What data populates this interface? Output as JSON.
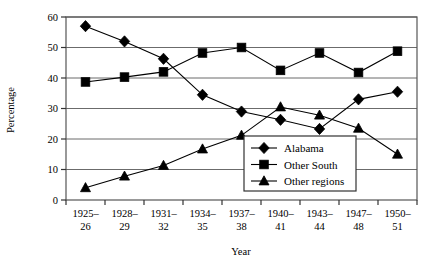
{
  "chart_data": {
    "type": "line",
    "title": "",
    "xlabel": "Year",
    "ylabel": "Percentage",
    "categories": [
      "1925–\n26",
      "1928–\n29",
      "1931–\n32",
      "1934–\n35",
      "1937–\n38",
      "1940–\n41",
      "1943–\n44",
      "1947–\n48",
      "1950–\n51"
    ],
    "categories_line1": [
      "1925–",
      "1928–",
      "1931–",
      "1934–",
      "1937–",
      "1940–",
      "1943–",
      "1947–",
      "1950–"
    ],
    "categories_line2": [
      "26",
      "29",
      "32",
      "35",
      "38",
      "41",
      "44",
      "48",
      "51"
    ],
    "ylim": [
      0,
      60
    ],
    "yticks": [
      0,
      10,
      20,
      30,
      40,
      50,
      60
    ],
    "ytick_labels": [
      "0",
      "10",
      "20",
      "30",
      "40",
      "50",
      "60"
    ],
    "grid": true,
    "legend_position": "center-right-inside",
    "series": [
      {
        "name": "Alabama",
        "marker": "diamond",
        "values": [
          57.0,
          52.0,
          46.3,
          34.5,
          29.0,
          26.3,
          23.3,
          33.0,
          35.5
        ]
      },
      {
        "name": "Other South",
        "marker": "square",
        "values": [
          38.7,
          40.3,
          42.0,
          48.2,
          50.0,
          42.5,
          48.2,
          41.8,
          48.8
        ]
      },
      {
        "name": "Other regions",
        "marker": "triangle",
        "values": [
          4.0,
          7.8,
          11.3,
          16.7,
          21.2,
          30.5,
          27.8,
          23.5,
          15.0
        ]
      }
    ],
    "colors": {
      "series": "#000000",
      "grid": "#6b6b6b",
      "frame": "#555555",
      "background": "#ffffff"
    }
  },
  "legend": {
    "items": [
      {
        "label": "Alabama",
        "marker": "diamond"
      },
      {
        "label": "Other South",
        "marker": "square"
      },
      {
        "label": "Other regions",
        "marker": "triangle"
      }
    ]
  },
  "axes": {
    "y_title": "Percentage",
    "x_title": "Year"
  }
}
